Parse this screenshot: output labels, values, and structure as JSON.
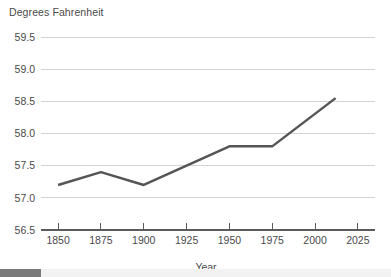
{
  "chart_data": {
    "type": "line",
    "title": "Degrees Fahrenheit",
    "xlabel": "Year",
    "ylabel": "",
    "xlim": [
      1840,
      2035
    ],
    "ylim": [
      56.5,
      59.5
    ],
    "grid": true,
    "legend": false,
    "x_ticks": [
      1850,
      1875,
      1900,
      1925,
      1950,
      1975,
      2000,
      2025
    ],
    "x_tick_labels": [
      "1850",
      "1875",
      "1900",
      "1925",
      "1950",
      "1975",
      "2000",
      "2025"
    ],
    "y_ticks": [
      56.5,
      57.0,
      57.5,
      58.0,
      58.5,
      59.0,
      59.5
    ],
    "y_tick_labels": [
      "56.5",
      "57.0",
      "57.5",
      "58.0",
      "58.5",
      "59.0",
      "59.5"
    ],
    "series": [
      {
        "name": "Global average temperature",
        "color": "#555555",
        "x": [
          1850,
          1875,
          1900,
          1925,
          1950,
          1975,
          2012
        ],
        "values": [
          57.2,
          57.4,
          57.2,
          57.5,
          57.8,
          57.8,
          58.55
        ]
      }
    ]
  },
  "styles": {
    "grid_color": "#d3d3d3",
    "axis_color": "#5a5a5a",
    "text_color": "#4a4a4a",
    "line_color": "#555555",
    "background": "#ffffff",
    "scrollbar_track": "#f2f2f2",
    "scrollbar_thumb": "#7a7a7a"
  },
  "scrollbar": {
    "orientation": "horizontal",
    "thumb_label": ""
  }
}
